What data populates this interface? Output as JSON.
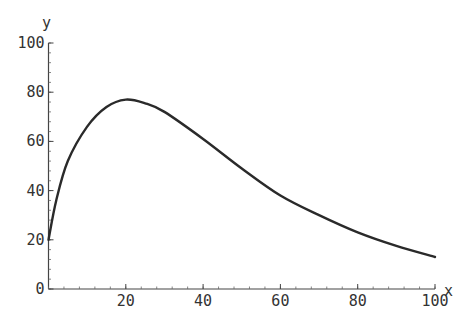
{
  "chart_data": {
    "type": "line",
    "title": "",
    "xlabel": "x",
    "ylabel": "y",
    "xlim": [
      0,
      100
    ],
    "ylim": [
      0,
      100
    ],
    "grid": false,
    "legend": null,
    "x_ticks": [
      20,
      40,
      60,
      80,
      100
    ],
    "y_ticks": [
      0,
      20,
      40,
      60,
      80,
      100
    ],
    "series": [
      {
        "name": "curve",
        "x": [
          0,
          2,
          5,
          10,
          15,
          20,
          25,
          30,
          40,
          50,
          60,
          70,
          80,
          90,
          100
        ],
        "y": [
          20,
          36,
          52,
          66,
          74,
          77,
          75.5,
          72,
          61,
          49,
          38,
          30,
          23,
          17.5,
          13
        ]
      }
    ]
  }
}
